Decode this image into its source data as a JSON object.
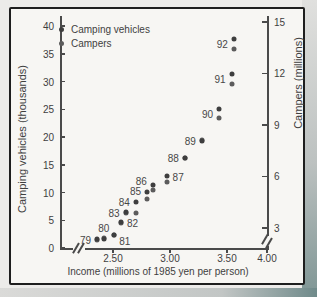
{
  "chart_data": {
    "type": "scatter",
    "title": "",
    "xlabel": "Income (millions of 1985 yen per person)",
    "ylabel_left": "Camping vehicles (thousands)",
    "ylabel_right": "Campers (millions)",
    "x_ticks": [
      {
        "label": "2.50",
        "value": 2.5
      },
      {
        "label": "3.00",
        "value": 3.0
      },
      {
        "label": "3.50",
        "value": 3.5
      },
      {
        "label": "4.00",
        "value": 4.0
      }
    ],
    "y_ticks_left": [
      "0",
      "5",
      "10",
      "15",
      "20",
      "25",
      "30",
      "35",
      "40"
    ],
    "y_ticks_right": [
      "3",
      "6",
      "9",
      "12",
      "15"
    ],
    "ylim_left": [
      0,
      40
    ],
    "ylim_right": [
      3,
      15
    ],
    "xlim": [
      2.3,
      4.0
    ],
    "x_axis_break_near_origin": true,
    "right_axis_break_near_bottom": true,
    "grid": false,
    "legend_position": "top-left",
    "series": [
      {
        "name": "Camping vehicles",
        "color": "#3e3e3e",
        "axis": "left"
      },
      {
        "name": "Campers",
        "color": "#5c5c5c",
        "axis": "right"
      }
    ],
    "points": [
      {
        "year": "79",
        "income": 2.36,
        "vehicles": 1.6,
        "campers": 2.3,
        "label_side": "left"
      },
      {
        "year": "80",
        "income": 2.42,
        "vehicles": 1.7,
        "campers": 2.4,
        "label_side": "above"
      },
      {
        "year": "81",
        "income": 2.51,
        "vehicles": 2.4,
        "campers": 2.6,
        "label_side": "below-right"
      },
      {
        "year": "82",
        "income": 2.57,
        "vehicles": 4.6,
        "campers": 3.3,
        "label_side": "right"
      },
      {
        "year": "83",
        "income": 2.61,
        "vehicles": 6.4,
        "campers": 3.9,
        "label_side": "left"
      },
      {
        "year": "84",
        "income": 2.7,
        "vehicles": 8.3,
        "campers": 3.9,
        "label_side": "left",
        "label_dy": -5
      },
      {
        "year": "85",
        "income": 2.8,
        "vehicles": 10.1,
        "campers": 4.7,
        "label_side": "left",
        "label_dy": -4
      },
      {
        "year": "86",
        "income": 2.85,
        "vehicles": 11.4,
        "campers": 5.2,
        "label_side": "left",
        "label_dy": -6
      },
      {
        "year": "87",
        "income": 2.97,
        "vehicles": 13.0,
        "campers": 5.7,
        "label_side": "right",
        "label_dy": -2
      },
      {
        "year": "88",
        "income": 3.13,
        "vehicles": 16.3,
        "campers": 7.1,
        "label_side": "left"
      },
      {
        "year": "89",
        "income": 3.28,
        "vehicles": 19.3,
        "campers": 8.1,
        "label_side": "left"
      },
      {
        "year": "90",
        "income": 3.43,
        "vehicles": 25.0,
        "campers": 9.4,
        "label_side": "left"
      },
      {
        "year": "91",
        "income": 3.54,
        "vehicles": 31.3,
        "campers": 11.4,
        "label_side": "left"
      },
      {
        "year": "92",
        "income": 3.56,
        "vehicles": 37.6,
        "campers": 13.4,
        "label_side": "left"
      }
    ]
  }
}
